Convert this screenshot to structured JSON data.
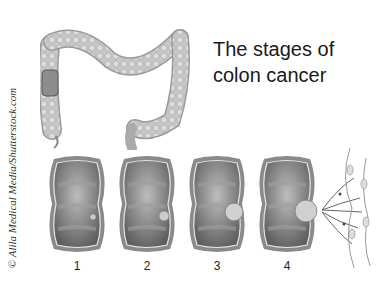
{
  "title": {
    "line1": "The stages of",
    "line2": "colon cancer"
  },
  "credit": "© Alila Medical Media/Shutterstock.com",
  "stages": [
    {
      "label": "1",
      "tumor_size": "small"
    },
    {
      "label": "2",
      "tumor_size": "medium"
    },
    {
      "label": "3",
      "tumor_size": "large"
    },
    {
      "label": "4",
      "tumor_size": "large-spread"
    }
  ],
  "colors": {
    "tissue": "#7a7a7a",
    "tissue_light": "#bdbdbd",
    "text": "#1a1a1a"
  }
}
